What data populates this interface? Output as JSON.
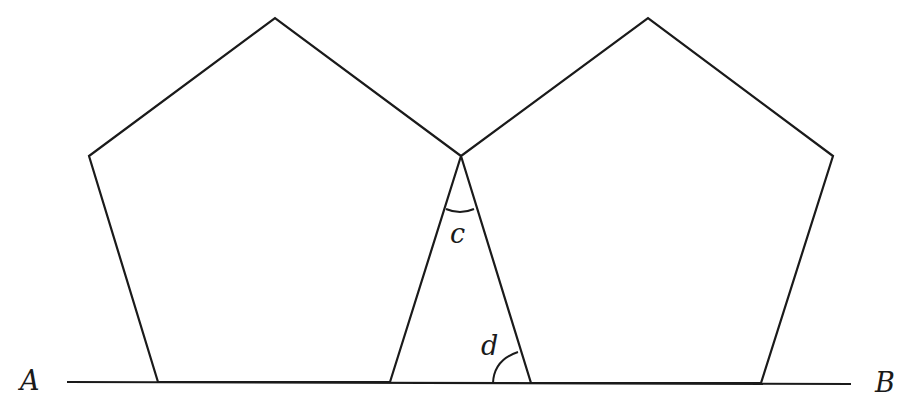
{
  "diagram": {
    "line": {
      "start_label": "A",
      "end_label": "B"
    },
    "angles": [
      {
        "label": "c",
        "location": "apex between pentagons"
      },
      {
        "label": "d",
        "location": "base on line AB"
      }
    ],
    "stroke_color": "#1a1a1a",
    "background_color": "#ffffff"
  }
}
